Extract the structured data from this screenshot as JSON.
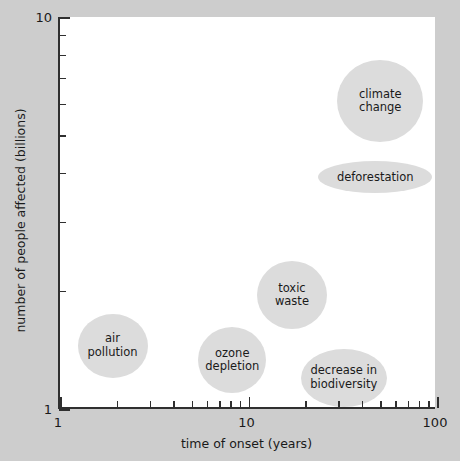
{
  "chart_data": {
    "type": "scatter",
    "title": "",
    "subtitle": "",
    "xlabel": "time of onset (years)",
    "ylabel": "number of people affected (billions)",
    "xscale": "log",
    "yscale": "log",
    "xlim": [
      1,
      100
    ],
    "ylim": [
      1,
      10
    ],
    "xticks": [
      1,
      10,
      100
    ],
    "xtick_labels": [
      "1",
      "10",
      "100"
    ],
    "yticks": [
      1,
      10
    ],
    "ytick_labels": [
      "1",
      "10"
    ],
    "grid": false,
    "legend": "none",
    "bubble_color": "#dcdcdc",
    "plot_background": "#ffffff",
    "figure_background": "#cdcdcd",
    "axis_color": "#2f2f2f",
    "points": [
      {
        "label": "climate\nchange",
        "name": "climate change",
        "x": 50,
        "y": 6.1,
        "rx_px": 43,
        "ry_px": 41
      },
      {
        "label": "deforestation",
        "name": "deforestation",
        "x": 47,
        "y": 3.9,
        "rx_px": 57,
        "ry_px": 16
      },
      {
        "label": "toxic\nwaste",
        "name": "toxic waste",
        "x": 17,
        "y": 1.95,
        "rx_px": 35,
        "ry_px": 34
      },
      {
        "label": "air\npollution",
        "name": "air pollution",
        "x": 1.9,
        "y": 1.45,
        "rx_px": 35,
        "ry_px": 32
      },
      {
        "label": "ozone\ndepletion",
        "name": "ozone depletion",
        "x": 8.2,
        "y": 1.33,
        "rx_px": 34,
        "ry_px": 33
      },
      {
        "label": "decrease in\nbiodiversity",
        "name": "decrease in biodiversity",
        "x": 32,
        "y": 1.2,
        "rx_px": 43,
        "ry_px": 29
      }
    ]
  }
}
